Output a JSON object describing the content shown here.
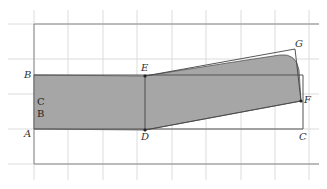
{
  "diagram": {
    "type": "geometry-grid-figure",
    "grid": {
      "color": "#d8d8d8",
      "vertical_x": [
        34,
        68,
        103,
        137,
        172,
        206,
        241,
        275,
        309
      ],
      "horizontal_y": [
        24,
        59,
        94,
        129,
        164
      ]
    },
    "outer_frame": {
      "x1": 34,
      "y1": 24,
      "x2": 319,
      "y2": 164,
      "color": "#777777"
    },
    "inner_rect": {
      "x1": 34,
      "y1": 75,
      "x2": 302,
      "y2": 129,
      "color": "#555555"
    },
    "shape_fill": "#a6a6a6",
    "points": {
      "A": {
        "label": "A",
        "x": 34,
        "y": 129
      },
      "B": {
        "label": "B",
        "x": 34,
        "y": 75
      },
      "C": {
        "label": "C",
        "x": 302,
        "y": 129
      },
      "D": {
        "label": "D",
        "x": 145,
        "y": 130
      },
      "E": {
        "label": "E",
        "x": 145,
        "y": 76
      },
      "F": {
        "label": "F",
        "x": 300,
        "y": 102
      },
      "G": {
        "label": "G",
        "x": 295,
        "y": 49
      }
    },
    "region_labels": [
      "C",
      "B"
    ]
  }
}
